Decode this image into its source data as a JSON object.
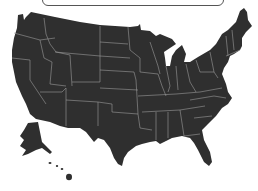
{
  "map": {
    "title": "United States map",
    "fill_color": "#2f2f2f",
    "border_color": "#9a9a9a",
    "regions": [
      "contiguous-us",
      "alaska",
      "hawaii"
    ]
  },
  "top_box": {
    "label": ""
  }
}
